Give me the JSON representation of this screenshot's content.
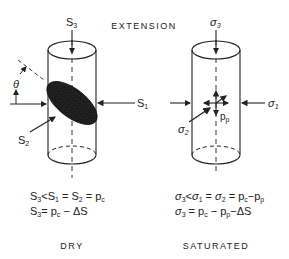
{
  "title": "EXTENSION",
  "left_panel": {
    "caption": "DRY",
    "labels": {
      "top": "S",
      "top_sub": "3",
      "right": "S",
      "right_sub": "1",
      "left": "S",
      "left_sub": "2",
      "angle": "θ"
    },
    "equations": [
      {
        "text": "S₃ < S₁ = S₂ = p_c"
      },
      {
        "text": "S₃ = p_c − ΔS"
      }
    ]
  },
  "right_panel": {
    "caption": "SATURATED",
    "labels": {
      "top": "σ",
      "top_sub": "3",
      "right": "σ",
      "right_sub": "1",
      "left": "σ",
      "left_sub": "2",
      "pore": "p",
      "pore_sub": "p"
    },
    "equations": [
      {
        "text": "σ₃ < σ₁ = σ₂ = p_c − p_p"
      },
      {
        "text": "σ₃ = p_c − p_p − ΔS"
      }
    ]
  },
  "colors": {
    "ink": "#222222",
    "fracture": "#1a1a1a",
    "background": "#ffffff"
  }
}
